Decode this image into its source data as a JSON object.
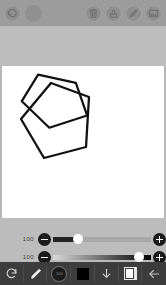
{
  "app": {
    "title": "Drawing Canvas",
    "background": "#b7b7b7"
  },
  "topbar": {
    "background": "#9c9c9c",
    "left_items": [
      {
        "name": "undo-icon",
        "label": "Undo"
      },
      {
        "name": "color-blob",
        "label": "Color"
      }
    ],
    "right_items": [
      {
        "name": "trash-icon",
        "label": "Delete"
      },
      {
        "name": "stamp-icon",
        "label": "Stamp"
      },
      {
        "name": "pencil-icon",
        "label": "Edit"
      },
      {
        "name": "image-icon",
        "label": "Image"
      }
    ]
  },
  "canvas": {
    "background": "#ffffff",
    "stroke_color": "#111111",
    "shape": "pentagon",
    "stroke_width": 2.2
  },
  "sliders": [
    {
      "name": "opacity-slider",
      "value": "100",
      "minus_label": "−",
      "plus_label": "+",
      "knob_percent": 25
    },
    {
      "name": "brush-size-slider",
      "value": "100",
      "minus_label": "−",
      "plus_label": "+",
      "knob_percent": 88
    }
  ],
  "bottombar": {
    "background": "#3c3c3c",
    "items": [
      {
        "name": "rotate-icon",
        "label": "Transform",
        "active": false
      },
      {
        "name": "brush-icon",
        "label": "Brush",
        "active": false
      },
      {
        "name": "color-picker-icon",
        "label": "Color",
        "active": false
      },
      {
        "name": "fill-swatch-icon",
        "label": "Fill",
        "active": false
      },
      {
        "name": "download-icon",
        "label": "Download",
        "active": false
      },
      {
        "name": "layers-icon",
        "label": "Layers",
        "active": true
      },
      {
        "name": "back-arrow-icon",
        "label": "Back",
        "active": false
      }
    ]
  }
}
